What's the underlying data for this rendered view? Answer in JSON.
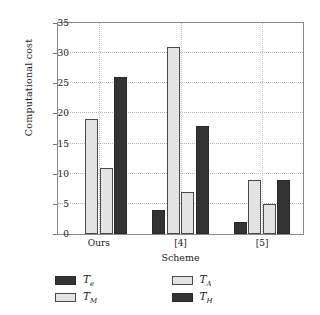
{
  "chart_data": {
    "type": "bar",
    "title": "",
    "xlabel": "Scheme",
    "ylabel": "Computational cost",
    "categories": [
      "Ours",
      "[4]",
      "[5]"
    ],
    "ylim": [
      0,
      35
    ],
    "yticks": [
      0,
      5,
      10,
      15,
      20,
      25,
      30,
      35
    ],
    "ytick_labels": [
      "0",
      "5",
      "10",
      "15",
      "20",
      "25",
      "30",
      "35"
    ],
    "grid": true,
    "grid_axis": "both",
    "legend_position": "below-plot",
    "series": [
      {
        "name": "Te",
        "label_base": "T",
        "label_sub": "e",
        "color": "#333333",
        "style": "dark",
        "values": [
          0,
          4,
          2
        ]
      },
      {
        "name": "TM",
        "label_base": "T",
        "label_sub": "M",
        "color": "#e3e3e3",
        "style": "light",
        "values": [
          19,
          31,
          9
        ]
      },
      {
        "name": "TA",
        "label_base": "T",
        "label_sub": "A",
        "color": "#e3e3e3",
        "style": "light",
        "values": [
          11,
          7,
          5
        ]
      },
      {
        "name": "TH",
        "label_base": "T",
        "label_sub": "H",
        "color": "#333333",
        "style": "dark",
        "values": [
          26,
          18,
          9
        ]
      }
    ]
  },
  "legend": {
    "items": [
      {
        "base": "T",
        "sub": "e",
        "style": "dark"
      },
      {
        "base": "T",
        "sub": "A",
        "style": "light"
      },
      {
        "base": "T",
        "sub": "M",
        "style": "light"
      },
      {
        "base": "T",
        "sub": "H",
        "style": "dark"
      }
    ]
  }
}
